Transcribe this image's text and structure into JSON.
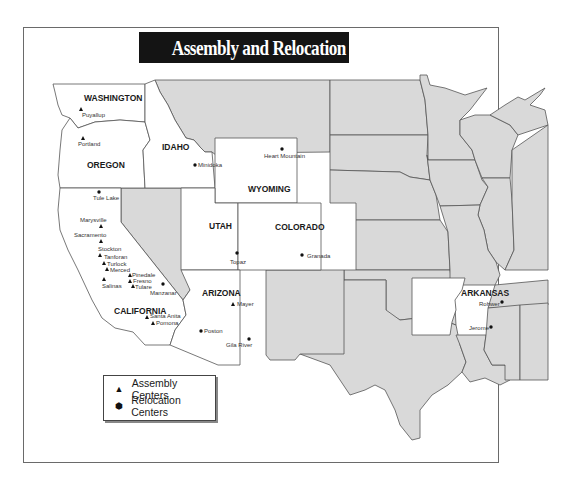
{
  "title": "Assembly and Relocation Centers",
  "legend": {
    "items": [
      {
        "symbol": "▲",
        "icon": "triangle-icon",
        "label": "Assembly Centers"
      },
      {
        "symbol": "⬢",
        "icon": "hexagon-dot-icon",
        "label": "Relocation Centers"
      }
    ]
  },
  "colors": {
    "highlighted_state": "#ffffff",
    "other_state": "#d9d9d9",
    "border": "#555555",
    "title_bg": "#141414"
  },
  "states": {
    "washington": "WASHINGTON",
    "oregon": "OREGON",
    "idaho": "IDAHO",
    "wyoming": "WYOMING",
    "california": "CALIFORNIA",
    "utah": "UTAH",
    "colorado": "COLORADO",
    "arizona": "ARIZONA",
    "arkansas": "ARKANSAS"
  },
  "assembly_centers": {
    "puyallup": "Puyallup",
    "portland": "Portland",
    "marysville": "Marysville",
    "sacramento": "Sacramento",
    "stockton": "Stockton",
    "tanforan": "Tanforan",
    "turlock": "Turlock",
    "merced": "Merced",
    "pinedale": "Pinedale",
    "fresno": "Fresno",
    "salinas": "Salinas",
    "tulare": "Tulare",
    "santa_anita": "Santa Anita",
    "pomona": "Pomona",
    "mayer": "Mayer"
  },
  "relocation_centers": {
    "tule_lake": "Tule Lake",
    "minidoka": "Minidoka",
    "heart_mountain": "Heart Mountain",
    "manzanar": "Manzanar",
    "topaz": "Topaz",
    "granada": "Granada",
    "poston": "Poston",
    "gila_river": "Gila River",
    "rohwer": "Rohwer",
    "jerome": "Jerome"
  }
}
